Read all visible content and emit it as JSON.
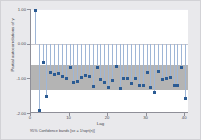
{
  "chart_data": {
    "type": "bar",
    "title": "",
    "subtitle": "",
    "xlabel": "Lag",
    "ylabel": "Partial autocorrelations of y",
    "note": "95% Confidence bands [se = 1/sqrt(n)]",
    "xlim": [
      0,
      41
    ],
    "ylim": [
      -2.0,
      1.0
    ],
    "grid": false,
    "legend_position": "none",
    "yticks": [
      "1.00",
      "0.00",
      "-1.00",
      "-2.00"
    ],
    "ytick_values": [
      1.0,
      0.0,
      -1.0,
      -2.0
    ],
    "xticks": [
      "0",
      "10",
      "20",
      "30",
      "40"
    ],
    "xtick_values": [
      0,
      10,
      20,
      30,
      40
    ],
    "confidence_band": {
      "label": "95% confidence band",
      "upper": -0.62,
      "lower": -1.33,
      "color": "#b0b0b0"
    },
    "series": [
      {
        "name": "Partial autocorrelations of y",
        "marker_color": "#2b5b93",
        "spike_color": "#9fb6d6",
        "x": [
          1,
          2,
          3,
          4,
          5,
          6,
          7,
          8,
          9,
          10,
          11,
          12,
          13,
          14,
          15,
          16,
          17,
          18,
          19,
          20,
          21,
          22,
          23,
          24,
          25,
          26,
          27,
          28,
          29,
          30,
          31,
          32,
          33,
          34,
          35,
          36,
          37,
          38,
          39,
          40
        ],
        "values": [
          0.98,
          -1.9,
          -0.53,
          -1.52,
          -0.83,
          -0.88,
          -0.84,
          -0.94,
          -0.98,
          -0.68,
          -1.12,
          -1.07,
          -0.95,
          -0.91,
          -0.93,
          -1.22,
          -0.66,
          -1.01,
          -1.1,
          -1.25,
          -1.05,
          -0.63,
          -1.29,
          -0.99,
          -0.98,
          -1.14,
          -1.0,
          -1.19,
          -1.18,
          -0.83,
          -1.24,
          -1.4,
          -0.79,
          -1.03,
          -1.0,
          -0.95,
          -1.18,
          -1.18,
          -0.67,
          -1.58
        ]
      }
    ]
  }
}
